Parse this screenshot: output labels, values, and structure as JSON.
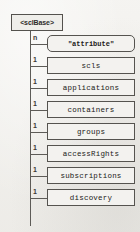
{
  "diagram": {
    "type": "tree",
    "root": {
      "label": "<sclBase>",
      "shape": "rectangle"
    },
    "children": [
      {
        "cardinality": "n",
        "label": "\"attribute\"",
        "shape": "rounded-rectangle"
      },
      {
        "cardinality": "1",
        "label": "scls",
        "shape": "rectangle"
      },
      {
        "cardinality": "1",
        "label": "applications",
        "shape": "rectangle"
      },
      {
        "cardinality": "1",
        "label": "containers",
        "shape": "rectangle"
      },
      {
        "cardinality": "1",
        "label": "groups",
        "shape": "rectangle"
      },
      {
        "cardinality": "1",
        "label": "accessRights",
        "shape": "rectangle"
      },
      {
        "cardinality": "1",
        "label": "subscriptions",
        "shape": "rectangle"
      },
      {
        "cardinality": "1",
        "label": "discovery",
        "shape": "rectangle"
      }
    ],
    "colors": {
      "background": "#f2f1ee",
      "stroke": "#55534f",
      "text": "#222018",
      "box_fill": "#f3f2ef"
    },
    "layout": {
      "trunk_x": 30,
      "row_height": 22,
      "first_row_y": 33
    }
  }
}
